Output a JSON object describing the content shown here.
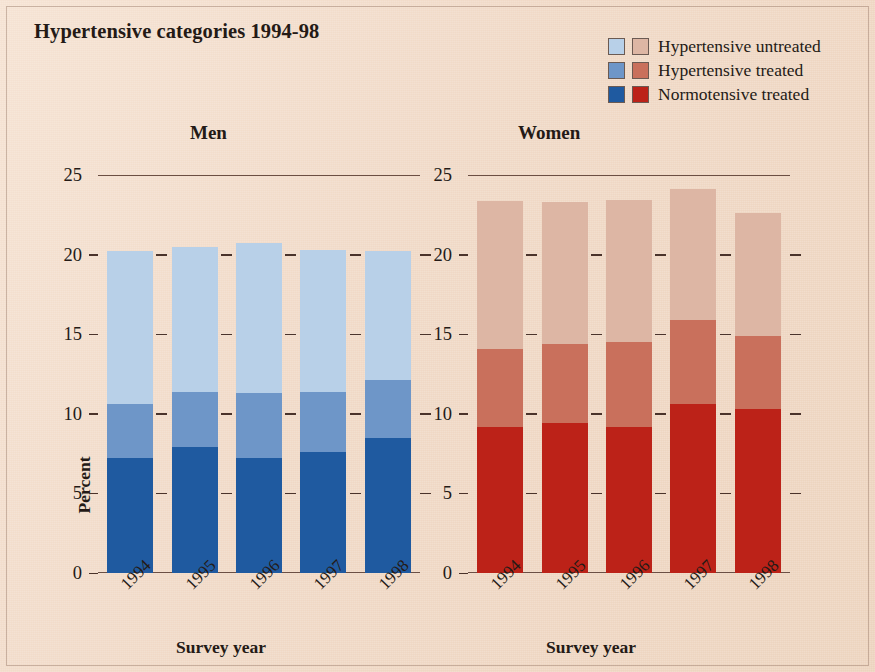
{
  "title": "Hypertensive categories 1994-98",
  "legend": {
    "items": [
      {
        "label": "Hypertensive untreated",
        "men_color": "#b8d0e8",
        "women_color": "#ddb6a4"
      },
      {
        "label": "Hypertensive treated",
        "men_color": "#6e96c8",
        "women_color": "#c9705c"
      },
      {
        "label": "Normotensive treated",
        "men_color": "#1f5aa0",
        "women_color": "#bc2218"
      }
    ]
  },
  "panels": {
    "men": {
      "title": "Men",
      "xlabel": "Survey year",
      "ylabel": "Percent"
    },
    "women": {
      "title": "Women",
      "xlabel": "Survey year",
      "ylabel": ""
    }
  },
  "axis": {
    "yticks": [
      "25",
      "20",
      "15",
      "10",
      "5",
      "0"
    ],
    "ymin": 0,
    "ymax": 25
  },
  "chart_data": [
    {
      "type": "bar",
      "title": "Men",
      "subplot": "men",
      "stacked": true,
      "categories": [
        "1994",
        "1995",
        "1996",
        "1997",
        "1998"
      ],
      "series": [
        {
          "name": "Normotensive treated",
          "color": "#1f5aa0",
          "values": [
            7.25,
            7.9,
            7.25,
            7.6,
            8.5
          ]
        },
        {
          "name": "Hypertensive treated",
          "color": "#6e96c8",
          "values": [
            3.35,
            3.5,
            4.05,
            3.8,
            3.6
          ]
        },
        {
          "name": "Hypertensive untreated",
          "color": "#b8d0e8",
          "values": [
            9.6,
            9.1,
            9.45,
            8.9,
            8.1
          ]
        }
      ],
      "totals": [
        20.2,
        20.5,
        20.75,
        20.3,
        20.2
      ],
      "xlabel": "Survey year",
      "ylabel": "Percent",
      "ylim": [
        0,
        25
      ],
      "yticks": [
        0,
        5,
        10,
        15,
        20,
        25
      ],
      "grid": false,
      "legend_position": "top-right"
    },
    {
      "type": "bar",
      "title": "Women",
      "subplot": "women",
      "stacked": true,
      "categories": [
        "1994",
        "1995",
        "1996",
        "1997",
        "1998"
      ],
      "series": [
        {
          "name": "Normotensive treated",
          "color": "#bc2218",
          "values": [
            9.2,
            9.4,
            9.2,
            10.6,
            10.3
          ]
        },
        {
          "name": "Hypertensive treated",
          "color": "#c9705c",
          "values": [
            4.9,
            5.0,
            5.3,
            5.3,
            4.6
          ]
        },
        {
          "name": "Hypertensive untreated",
          "color": "#ddb6a4",
          "values": [
            9.3,
            8.9,
            8.9,
            8.2,
            7.7
          ]
        }
      ],
      "totals": [
        23.4,
        23.3,
        23.4,
        24.1,
        22.6
      ],
      "xlabel": "Survey year",
      "ylabel": "",
      "ylim": [
        0,
        25
      ],
      "yticks": [
        0,
        5,
        10,
        15,
        20,
        25
      ],
      "grid": false,
      "legend_position": "top-right"
    }
  ],
  "colors": {
    "background": "#f0d9c6",
    "axis": "#6b4f44",
    "text": "#241a16"
  }
}
